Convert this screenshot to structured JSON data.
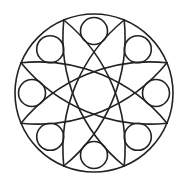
{
  "figure": {
    "title": "Circular geometric mandala pattern",
    "width": 190,
    "height": 185,
    "background": "#ffffff",
    "stroke_color": "#222222",
    "stroke_width": 1.6
  },
  "outer_circle": {
    "cx": 94,
    "cy": 93,
    "r": 79
  },
  "small_circles": [
    {
      "position": "right",
      "cx": 156,
      "cy": 93,
      "r": 13.5
    },
    {
      "position": "bottom-right",
      "cx": 137.8,
      "cy": 136.8,
      "r": 13.5
    },
    {
      "position": "bottom",
      "cx": 94,
      "cy": 155,
      "r": 13.5
    },
    {
      "position": "bottom-left",
      "cx": 50.2,
      "cy": 136.8,
      "r": 13.5
    },
    {
      "position": "left",
      "cx": 32,
      "cy": 93,
      "r": 13.5
    },
    {
      "position": "top-left",
      "cx": 50.2,
      "cy": 49.2,
      "r": 13.5
    },
    {
      "position": "top",
      "cx": 94,
      "cy": 31,
      "r": 13.5
    },
    {
      "position": "top-right",
      "cx": 137.8,
      "cy": 49.2,
      "r": 13.5
    }
  ],
  "lenses": [
    {
      "from": [
        167.0,
        123.2
      ],
      "to": [
        21.0,
        62.8
      ],
      "arc_radius": 166
    },
    {
      "from": [
        124.2,
        166.0
      ],
      "to": [
        63.8,
        20.0
      ],
      "arc_radius": 166
    },
    {
      "from": [
        63.8,
        166.0
      ],
      "to": [
        124.2,
        20.0
      ],
      "arc_radius": 166
    },
    {
      "from": [
        21.0,
        123.2
      ],
      "to": [
        167.0,
        62.8
      ],
      "arc_radius": 166
    }
  ]
}
